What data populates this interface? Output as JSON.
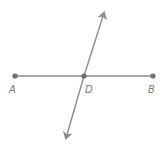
{
  "diagram": {
    "type": "geometry-lines",
    "colors": {
      "line": "#8c8c8c",
      "point": "#6f6f6f",
      "label": "#7a7a7a"
    },
    "points": [
      {
        "id": "A",
        "label": "A",
        "x": 15,
        "y": 76
      },
      {
        "id": "D",
        "label": "D",
        "x": 84,
        "y": 76
      },
      {
        "id": "B",
        "label": "B",
        "x": 153,
        "y": 76
      }
    ],
    "segment_AB": {
      "from": "A",
      "to": "B"
    },
    "line_through_D": {
      "arrow_top": {
        "x": 104,
        "y": 13
      },
      "arrow_bottom": {
        "x": 66,
        "y": 138
      }
    }
  }
}
